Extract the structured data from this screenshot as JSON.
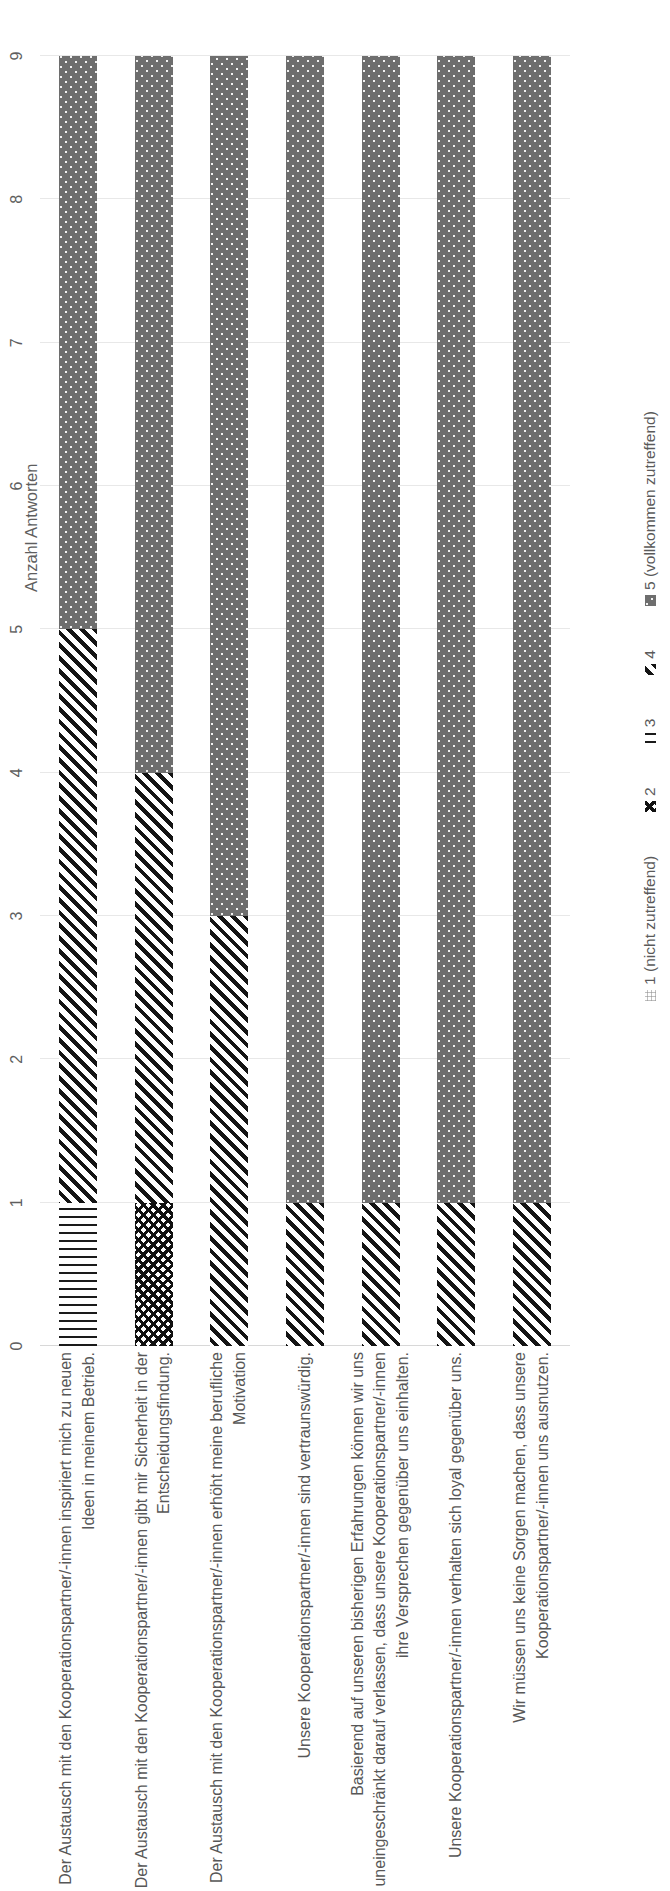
{
  "chart_data": {
    "type": "bar",
    "orientation": "horizontal-stacked",
    "title": "",
    "xlabel": "Anzahl Antworten",
    "ylabel": "",
    "xlim": [
      0,
      9
    ],
    "xticks": [
      "0",
      "1",
      "2",
      "3",
      "4",
      "5",
      "6",
      "7",
      "8",
      "9"
    ],
    "grid": true,
    "legend_position": "bottom",
    "categories": [
      "Der Austausch mit den Kooperationspartner/-innen inspiriert mich zu neuen\nIdeen in meinem Betrieb.",
      "Der Austausch mit den Kooperationspartner/-innen gibt mir Sicherheit in der\nEntscheidungsfindung.",
      "Der Austausch mit den Kooperationspartner/-innen erhöht meine berufliche\nMotivation",
      "Unsere Kooperationspartner/-innen sind vertraunswürdig.",
      "Basierend auf unseren bisherigen Erfahrungen können wir uns\nuneingeschränkt darauf verlassen, dass unsere Kooperationspartner/-innen\nihre Versprechen gegenüber uns einhalten.",
      "Unsere Kooperationspartner/-innen verhalten sich loyal gegenüber uns.",
      "Wir müssen uns keine Sorgen machen, dass unsere\nKooperationspartner/-innen uns ausnutzen."
    ],
    "series": [
      {
        "name": "1 (nicht zutreffend)",
        "pattern": "fine-grid",
        "values": [
          0,
          0,
          0,
          0,
          0,
          0,
          0
        ]
      },
      {
        "name": "2",
        "pattern": "diamond-checker",
        "values": [
          0,
          1,
          0,
          0,
          0,
          0,
          0
        ]
      },
      {
        "name": "3",
        "pattern": "vertical-lines",
        "values": [
          1,
          0,
          0,
          0,
          0,
          0,
          0
        ]
      },
      {
        "name": "4",
        "pattern": "diagonal-stripes",
        "values": [
          4,
          3,
          3,
          1,
          1,
          1,
          1
        ]
      },
      {
        "name": "5 (vollkommen zutreffend)",
        "pattern": "dotted-gray",
        "values": [
          4,
          5,
          6,
          8,
          8,
          8,
          8
        ]
      }
    ]
  },
  "legend": {
    "items": [
      {
        "label": "1 (nicht zutreffend)"
      },
      {
        "label": "2"
      },
      {
        "label": "3"
      },
      {
        "label": "4"
      },
      {
        "label": "5 (vollkommen zutreffend)"
      }
    ]
  },
  "axis": {
    "title": "Anzahl Antworten",
    "ticks": [
      "0",
      "1",
      "2",
      "3",
      "4",
      "5",
      "6",
      "7",
      "8",
      "9"
    ]
  }
}
